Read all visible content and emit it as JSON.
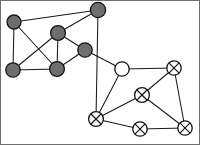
{
  "figure": {
    "width": 200,
    "height": 145,
    "background_color": "#ffffff",
    "border_color": "#6f6f6f",
    "edge_color": "#1a1a1a",
    "node_stroke_color": "#141414",
    "filled_node_color": "#6e6e6e",
    "open_node_color": "#ffffff"
  },
  "graph_data": {
    "type": "graph",
    "directed": false,
    "node_styles": {
      "filled": "solid gray disc with dark outline",
      "open": "white disc with dark outline",
      "crossed": "white disc with dark outline and an X drawn inside"
    },
    "nodes": [
      {
        "id": "g1",
        "label": "",
        "style": "filled",
        "cluster": "left",
        "x": 14,
        "y": 22,
        "r": 7.0
      },
      {
        "id": "g2",
        "label": "",
        "style": "filled",
        "cluster": "left",
        "x": 98,
        "y": 10,
        "r": 7.6
      },
      {
        "id": "g3",
        "label": "",
        "style": "filled",
        "cluster": "left",
        "x": 58,
        "y": 33,
        "r": 7.4
      },
      {
        "id": "g4",
        "label": "",
        "style": "filled",
        "cluster": "left",
        "x": 85,
        "y": 50,
        "r": 7.2
      },
      {
        "id": "g5",
        "label": "",
        "style": "filled",
        "cluster": "left",
        "x": 13,
        "y": 70,
        "r": 7.2
      },
      {
        "id": "g6",
        "label": "",
        "style": "filled",
        "cluster": "left",
        "x": 57,
        "y": 69,
        "r": 7.4
      },
      {
        "id": "w1",
        "label": "",
        "style": "open",
        "cluster": "right",
        "x": 122,
        "y": 69,
        "r": 7.2
      },
      {
        "id": "x1",
        "label": "",
        "style": "crossed",
        "cluster": "right",
        "x": 174,
        "y": 68,
        "r": 7.2
      },
      {
        "id": "x2",
        "label": "",
        "style": "crossed",
        "cluster": "right",
        "x": 142,
        "y": 95,
        "r": 7.4
      },
      {
        "id": "x3",
        "label": "",
        "style": "crossed",
        "cluster": "right",
        "x": 96,
        "y": 119,
        "r": 7.4
      },
      {
        "id": "x4",
        "label": "",
        "style": "crossed",
        "cluster": "right",
        "x": 140,
        "y": 129,
        "r": 7.2
      },
      {
        "id": "x5",
        "label": "",
        "style": "crossed",
        "cluster": "right",
        "x": 185,
        "y": 128,
        "r": 7.2
      }
    ],
    "edges": [
      {
        "source": "g1",
        "target": "g2"
      },
      {
        "source": "g1",
        "target": "g5"
      },
      {
        "source": "g1",
        "target": "g6"
      },
      {
        "source": "g2",
        "target": "g3"
      },
      {
        "source": "g2",
        "target": "x3"
      },
      {
        "source": "g3",
        "target": "g5"
      },
      {
        "source": "g3",
        "target": "g6"
      },
      {
        "source": "g3",
        "target": "g4"
      },
      {
        "source": "g4",
        "target": "g6"
      },
      {
        "source": "g4",
        "target": "w1"
      },
      {
        "source": "g5",
        "target": "g6"
      },
      {
        "source": "w1",
        "target": "x1"
      },
      {
        "source": "w1",
        "target": "x3"
      },
      {
        "source": "x1",
        "target": "x2"
      },
      {
        "source": "x1",
        "target": "x5"
      },
      {
        "source": "x2",
        "target": "x3"
      },
      {
        "source": "x2",
        "target": "x5"
      },
      {
        "source": "x3",
        "target": "x4"
      },
      {
        "source": "x4",
        "target": "x5"
      }
    ],
    "node_count": 12,
    "edge_count": 19,
    "clusters": [
      {
        "name": "left",
        "node_ids": [
          "g1",
          "g2",
          "g3",
          "g4",
          "g5",
          "g6"
        ],
        "style": "filled"
      },
      {
        "name": "right",
        "node_ids": [
          "w1",
          "x1",
          "x2",
          "x3",
          "x4",
          "x5"
        ],
        "style": "open-and-crossed"
      }
    ]
  }
}
